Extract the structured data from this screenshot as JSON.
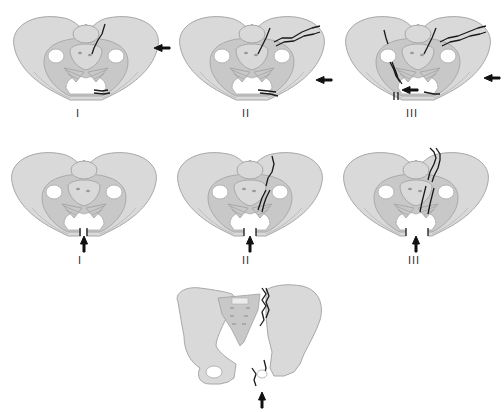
{
  "figure": {
    "rows": [
      {
        "id": "lateral-compression",
        "panels": [
          {
            "label": "I",
            "force_direction": "from-right-lateral",
            "fracture": "sacral compression + pubic rami"
          },
          {
            "label": "II",
            "force_direction": "from-right-lateral",
            "fracture": "iliac wing + pubic rami"
          },
          {
            "label": "III",
            "force_direction": "from-right-lateral with contralateral",
            "fracture": "windswept pelvis"
          }
        ]
      },
      {
        "id": "anteroposterior-compression",
        "panels": [
          {
            "label": "I",
            "force_direction": "from-anterior",
            "fracture": "symphysis widening"
          },
          {
            "label": "II",
            "force_direction": "from-anterior",
            "fracture": "anterior SI disruption"
          },
          {
            "label": "III",
            "force_direction": "from-anterior",
            "fracture": "complete SI disruption"
          }
        ]
      },
      {
        "id": "vertical-shear",
        "panels": [
          {
            "label": "",
            "force_direction": "from-below",
            "fracture": "vertical displacement of hemipelvis"
          }
        ]
      }
    ],
    "labels": {
      "r1_1": "I",
      "r1_2": "II",
      "r1_3": "III",
      "r2_1": "I",
      "r2_2": "II",
      "r2_3": "III"
    },
    "colors": {
      "bone": "#d9d9d9",
      "bone_outline": "#a8a8a8",
      "fracture_line": "#1a1a1a",
      "arrow": "#111111",
      "background": "#ffffff"
    }
  }
}
